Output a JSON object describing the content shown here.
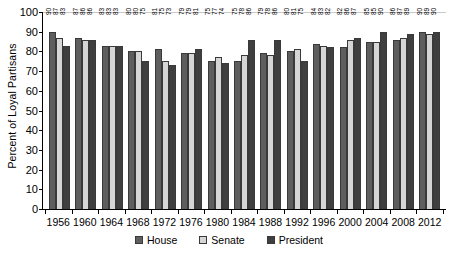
{
  "chart_data": {
    "type": "bar",
    "title": "",
    "xlabel": "",
    "ylabel": "Percent of Loyal Partisans",
    "ylim": [
      0,
      100
    ],
    "ytick_step": 10,
    "yticks": [
      0,
      10,
      20,
      30,
      40,
      50,
      60,
      70,
      80,
      90,
      100
    ],
    "grid": false,
    "legend_position": "bottom",
    "categories": [
      "1956",
      "1960",
      "1964",
      "1968",
      "1972",
      "1976",
      "1980",
      "1984",
      "1988",
      "1992",
      "1996",
      "2000",
      "2004",
      "2008",
      "2012"
    ],
    "series": [
      {
        "name": "House",
        "color": "#5e5e5e",
        "values": [
          90,
          87,
          83,
          80,
          81,
          79,
          75,
          75,
          79,
          80,
          84,
          82,
          85,
          86,
          90
        ]
      },
      {
        "name": "Senate",
        "color": "#d6d6d6",
        "values": [
          87,
          86,
          83,
          80,
          75,
          79,
          77,
          78,
          78,
          81,
          83,
          86,
          85,
          87,
          89
        ]
      },
      {
        "name": "President",
        "color": "#3f3f3f",
        "values": [
          83,
          86,
          83,
          75,
          73,
          81,
          74,
          86,
          86,
          75,
          82,
          87,
          90,
          89,
          90
        ]
      }
    ]
  },
  "legend": {
    "items": [
      {
        "label": "House",
        "key": "house"
      },
      {
        "label": "Senate",
        "key": "senate"
      },
      {
        "label": "President",
        "key": "president"
      }
    ]
  }
}
